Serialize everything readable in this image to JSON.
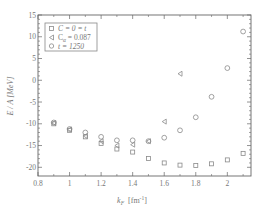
{
  "chart_data": {
    "type": "scatter",
    "title": "",
    "xlabel": "k_F [fm^-1]",
    "ylabel": "E/A [MeV]",
    "xlim": [
      0.8,
      2.15
    ],
    "ylim": [
      -22,
      15
    ],
    "xticks": [
      0.8,
      1.0,
      1.2,
      1.4,
      1.6,
      1.8,
      2.0
    ],
    "xtick_labels": [
      "0.8",
      "1",
      "1.2",
      "1.4",
      "1.6",
      "1.8",
      "2"
    ],
    "yticks": [
      -20,
      -15,
      -10,
      -5,
      0,
      5,
      10,
      15
    ],
    "ytick_labels": [
      "-20",
      "-15",
      "-10",
      "-5",
      "0",
      "5",
      "10",
      "15"
    ],
    "grid": false,
    "legend_position": "upper left",
    "series": [
      {
        "name": "C = 0 = t",
        "marker": "square",
        "x": [
          0.9,
          1.0,
          1.1,
          1.2,
          1.3,
          1.4,
          1.5,
          1.6,
          1.7,
          1.8,
          1.9,
          2.0,
          2.1
        ],
        "y": [
          -10.0,
          -11.5,
          -13.0,
          -14.5,
          -15.8,
          -16.5,
          -18.0,
          -19.0,
          -19.5,
          -19.6,
          -19.2,
          -18.3,
          -16.8
        ]
      },
      {
        "name": "C_α = 0.087",
        "marker": "triangle-left",
        "x": [
          0.9,
          1.0,
          1.1,
          1.2,
          1.3,
          1.4,
          1.5,
          1.6,
          1.7
        ],
        "y": [
          -9.8,
          -11.3,
          -12.8,
          -14.0,
          -15.0,
          -14.8,
          -14.0,
          -9.5,
          1.5
        ]
      },
      {
        "name": "t = 1250",
        "marker": "circle",
        "x": [
          0.9,
          1.0,
          1.1,
          1.2,
          1.3,
          1.4,
          1.5,
          1.6,
          1.7,
          1.8,
          1.9,
          2.0,
          2.1
        ],
        "y": [
          -9.7,
          -11.2,
          -12.0,
          -13.0,
          -13.8,
          -13.8,
          -14.0,
          -13.2,
          -11.5,
          -8.5,
          -3.8,
          2.8,
          11.2
        ]
      }
    ]
  },
  "legend": {
    "entries": [
      {
        "label_main": "C = 0 = t",
        "marker": "square"
      },
      {
        "label_main": "C",
        "label_sub": "α",
        "label_rest": " = 0.087",
        "marker": "triangle-left"
      },
      {
        "label_main": "t = 1250",
        "marker": "circle"
      }
    ]
  },
  "axes": {
    "xlabel_main": "k",
    "xlabel_sub": "F",
    "xlabel_unit": "[fm",
    "xlabel_sup": "-1",
    "xlabel_close": "]",
    "ylabel": "E / A  [MeV]"
  },
  "colors": {
    "axis": "#666666",
    "marker": "#8a8a8a",
    "text": "#777777"
  }
}
